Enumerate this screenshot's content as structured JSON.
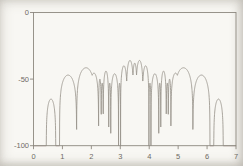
{
  "figure": {
    "background": "#f8f7f3",
    "axis_color": "#8d887f",
    "curve_color": "#9a958c",
    "label_color": "#6f6b63"
  },
  "chart_data": {
    "type": "line",
    "title": "",
    "xlabel": "",
    "ylabel": "",
    "unit": "dB",
    "xlim": [
      0,
      7
    ],
    "ylim": [
      -100,
      0
    ],
    "grid": false,
    "legend": false,
    "axis_box": true,
    "x_ticks": [
      0,
      1,
      2,
      3,
      4,
      5,
      6,
      7
    ],
    "x_tick_labels": [
      "0",
      "1",
      "2",
      "3",
      "4",
      "5",
      "6",
      "7"
    ],
    "y_ticks": [
      0,
      -50,
      -100
    ],
    "y_tick_labels": [
      "0",
      "-50",
      "-100"
    ],
    "curve_model": "y(x) = max over lobes of [ peak_db + 20*log10(|sin(pi*(x - x_start)/(x_end - x_start))|) ], clipped at -100 dB; flat at -100 dB outside all lobes",
    "lobes": [
      {
        "x_start": 0.44,
        "x_end": 0.77,
        "peak_db": -65
      },
      {
        "x_start": 0.9,
        "x_end": 1.49,
        "peak_db": -47
      },
      {
        "x_start": 1.49,
        "x_end": 2.14,
        "peak_db": -41.5
      },
      {
        "x_start": 1.93,
        "x_end": 2.25,
        "peak_db": -45.5
      },
      {
        "x_start": 2.25,
        "x_end": 2.34,
        "peak_db": -50
      },
      {
        "x_start": 2.34,
        "x_end": 2.41,
        "peak_db": -53
      },
      {
        "x_start": 2.41,
        "x_end": 2.6,
        "peak_db": -44
      },
      {
        "x_start": 2.6,
        "x_end": 2.67,
        "peak_db": -53
      },
      {
        "x_start": 2.67,
        "x_end": 2.94,
        "peak_db": -46
      },
      {
        "x_start": 2.94,
        "x_end": 3.01,
        "peak_db": -53
      },
      {
        "x_start": 3.01,
        "x_end": 3.24,
        "peak_db": -40
      },
      {
        "x_start": 3.21,
        "x_end": 3.46,
        "peak_db": -36
      },
      {
        "x_start": 3.42,
        "x_end": 3.58,
        "peak_db": -38
      },
      {
        "x_start": 3.54,
        "x_end": 3.79,
        "peak_db": -36
      },
      {
        "x_start": 3.76,
        "x_end": 3.99,
        "peak_db": -40
      },
      {
        "x_start": 3.99,
        "x_end": 4.06,
        "peak_db": -53
      },
      {
        "x_start": 4.06,
        "x_end": 4.33,
        "peak_db": -46
      },
      {
        "x_start": 4.33,
        "x_end": 4.4,
        "peak_db": -53
      },
      {
        "x_start": 4.4,
        "x_end": 4.59,
        "peak_db": -44
      },
      {
        "x_start": 4.59,
        "x_end": 4.66,
        "peak_db": -53
      },
      {
        "x_start": 4.66,
        "x_end": 4.75,
        "peak_db": -50
      },
      {
        "x_start": 4.75,
        "x_end": 5.07,
        "peak_db": -45.5
      },
      {
        "x_start": 4.86,
        "x_end": 5.51,
        "peak_db": -41.5
      },
      {
        "x_start": 5.51,
        "x_end": 6.1,
        "peak_db": -47
      },
      {
        "x_start": 6.23,
        "x_end": 6.56,
        "peak_db": -65
      }
    ]
  }
}
